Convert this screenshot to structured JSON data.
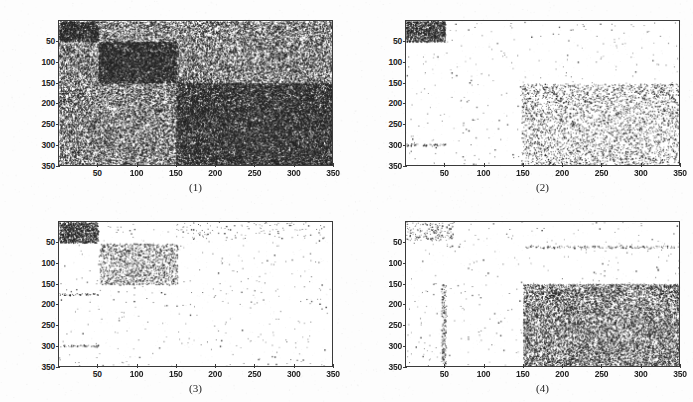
{
  "figure": {
    "title": "",
    "background_color": "#fdfdfd",
    "panel_count": 4,
    "point_color": "#222222",
    "axis_color": "#3a3a3a"
  },
  "axes": {
    "x_ticks": [
      "50",
      "100",
      "150",
      "200",
      "250",
      "300",
      "350"
    ],
    "y_ticks": [
      "50",
      "100",
      "150",
      "200",
      "250",
      "300",
      "350"
    ],
    "x_range": [
      0,
      350
    ],
    "y_range": [
      0,
      350
    ],
    "x_label": "",
    "y_label": "",
    "grid": "off",
    "y_axis_direction": "inverted"
  },
  "chart_data": {
    "type": "scatter",
    "title": "",
    "xlabel": "",
    "ylabel": "",
    "xlim": [
      0,
      350
    ],
    "ylim": [
      0,
      350
    ],
    "y_inverted": true,
    "grid": false,
    "legend": "none",
    "xticks": [
      50,
      100,
      150,
      200,
      250,
      300,
      350
    ],
    "yticks": [
      50,
      100,
      150,
      200,
      250,
      300,
      350
    ],
    "panels": [
      {
        "id": "1",
        "caption": "(1)",
        "blocks": [
          {
            "name": "background-noise",
            "x0": 0,
            "x1": 350,
            "y0": 0,
            "y1": 350,
            "density": 0.46
          },
          {
            "name": "block-top-left",
            "x0": 0,
            "x1": 50,
            "y0": 0,
            "y1": 50,
            "density": 0.7
          },
          {
            "name": "block-mid-left",
            "x0": 50,
            "x1": 150,
            "y0": 50,
            "y1": 150,
            "density": 0.78
          },
          {
            "name": "block-bottom-right",
            "x0": 150,
            "x1": 350,
            "y0": 150,
            "y1": 350,
            "density": 0.62
          }
        ]
      },
      {
        "id": "2",
        "caption": "(2)",
        "blocks": [
          {
            "name": "background-sparse",
            "x0": 0,
            "x1": 350,
            "y0": 0,
            "y1": 350,
            "density": 0.004
          },
          {
            "name": "block-top-left",
            "x0": 0,
            "x1": 50,
            "y0": 0,
            "y1": 50,
            "density": 0.85
          },
          {
            "name": "block-bottom-right",
            "x0": 148,
            "x1": 350,
            "y0": 152,
            "y1": 350,
            "density": 0.13
          },
          {
            "name": "hline-y300",
            "x0": 0,
            "x1": 52,
            "y0": 298,
            "y1": 303,
            "density": 0.3
          }
        ]
      },
      {
        "id": "3",
        "caption": "(3)",
        "blocks": [
          {
            "name": "background-sparse",
            "x0": 0,
            "x1": 350,
            "y0": 0,
            "y1": 350,
            "density": 0.004
          },
          {
            "name": "block-top-left",
            "x0": 0,
            "x1": 50,
            "y0": 0,
            "y1": 50,
            "density": 0.8
          },
          {
            "name": "block-mid",
            "x0": 52,
            "x1": 152,
            "y0": 52,
            "y1": 152,
            "density": 0.22
          },
          {
            "name": "hline-y175",
            "x0": 0,
            "x1": 50,
            "y0": 173,
            "y1": 178,
            "density": 0.26
          },
          {
            "name": "hline-y300",
            "x0": 0,
            "x1": 50,
            "y0": 298,
            "y1": 303,
            "density": 0.26
          },
          {
            "name": "vstreaks-top",
            "x0": 150,
            "x1": 340,
            "y0": 0,
            "y1": 40,
            "density": 0.02
          }
        ]
      },
      {
        "id": "4",
        "caption": "(4)",
        "blocks": [
          {
            "name": "background-sparse",
            "x0": 0,
            "x1": 350,
            "y0": 0,
            "y1": 350,
            "density": 0.004
          },
          {
            "name": "block-bottom-right",
            "x0": 150,
            "x1": 350,
            "y0": 150,
            "y1": 350,
            "density": 0.4
          },
          {
            "name": "cluster-top-left",
            "x0": 0,
            "x1": 60,
            "y0": 0,
            "y1": 45,
            "density": 0.09
          },
          {
            "name": "hline-y60",
            "x0": 150,
            "x1": 345,
            "y0": 57,
            "y1": 63,
            "density": 0.18
          },
          {
            "name": "vline-x48",
            "x0": 45,
            "x1": 51,
            "y0": 150,
            "y1": 345,
            "density": 0.22
          }
        ]
      }
    ]
  },
  "panels": [
    {
      "id": "1",
      "caption": "(1)"
    },
    {
      "id": "2",
      "caption": "(2)"
    },
    {
      "id": "3",
      "caption": "(3)"
    },
    {
      "id": "4",
      "caption": "(4)"
    }
  ]
}
